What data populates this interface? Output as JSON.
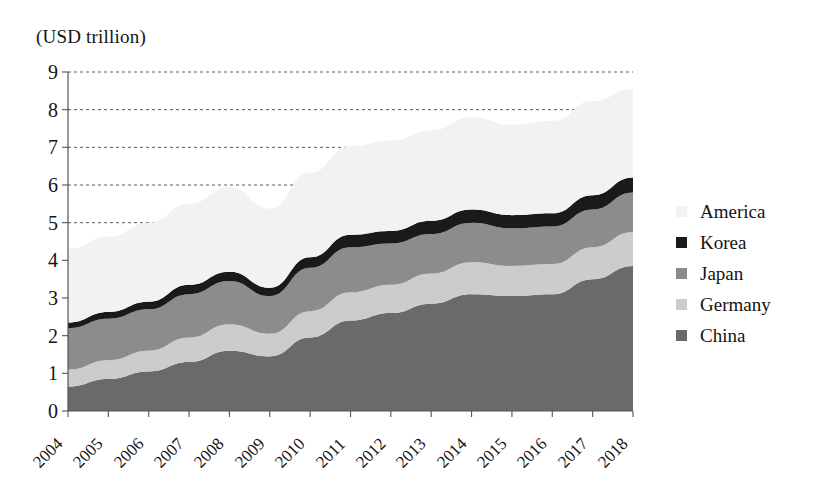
{
  "caption": {
    "unit": "(USD trillion)"
  },
  "legend": {
    "position": "right",
    "entries": [
      {
        "label": "America",
        "color": "#f2f2f2"
      },
      {
        "label": "Korea",
        "color": "#1a1a1a"
      },
      {
        "label": "Japan",
        "color": "#8c8c8c"
      },
      {
        "label": "Germany",
        "color": "#cccccc"
      },
      {
        "label": "China",
        "color": "#6a6a6a"
      }
    ]
  },
  "axes": {
    "y_label": "(USD trillion)",
    "y_ticks": [
      "9",
      "8",
      "7",
      "6",
      "5",
      "4",
      "3",
      "2",
      "1",
      "0"
    ],
    "x_ticks": [
      "2004",
      "2005",
      "2006",
      "2007",
      "2008",
      "2009",
      "2010",
      "2011",
      "2012",
      "2013",
      "2014",
      "2015",
      "2016",
      "2017",
      "2018"
    ]
  },
  "chart_data": {
    "type": "area",
    "stacked": true,
    "title": "",
    "subtitle": "",
    "xlabel": "",
    "ylabel": "(USD trillion)",
    "ylim": [
      0,
      9
    ],
    "grid": true,
    "grid_axis": "y",
    "grid_style": "dashed",
    "legend_position": "right",
    "x": [
      "2004",
      "2005",
      "2006",
      "2007",
      "2008",
      "2009",
      "2010",
      "2011",
      "2012",
      "2013",
      "2014",
      "2015",
      "2016",
      "2017",
      "2018"
    ],
    "stack_order_bottom_to_top": [
      "China",
      "Germany",
      "Japan",
      "Korea",
      "America"
    ],
    "series": [
      {
        "name": "China",
        "color": "#6a6a6a",
        "values": [
          0.65,
          0.85,
          1.05,
          1.3,
          1.6,
          1.45,
          1.95,
          2.4,
          2.6,
          2.85,
          3.1,
          3.05,
          3.1,
          3.5,
          3.85
        ]
      },
      {
        "name": "Germany",
        "color": "#cccccc",
        "values": [
          0.45,
          0.5,
          0.55,
          0.65,
          0.7,
          0.6,
          0.7,
          0.75,
          0.75,
          0.8,
          0.85,
          0.8,
          0.8,
          0.85,
          0.9
        ]
      },
      {
        "name": "Japan",
        "color": "#8c8c8c",
        "values": [
          1.1,
          1.1,
          1.1,
          1.15,
          1.15,
          1.0,
          1.15,
          1.2,
          1.1,
          1.05,
          1.05,
          1.0,
          1.0,
          1.0,
          1.05
        ]
      },
      {
        "name": "Korea",
        "color": "#1a1a1a",
        "values": [
          0.15,
          0.18,
          0.2,
          0.25,
          0.25,
          0.22,
          0.28,
          0.33,
          0.33,
          0.35,
          0.35,
          0.35,
          0.35,
          0.38,
          0.4
        ]
      },
      {
        "name": "America",
        "color": "#f2f2f2",
        "values": [
          1.95,
          2.0,
          2.1,
          2.15,
          2.25,
          2.1,
          2.25,
          2.35,
          2.4,
          2.4,
          2.45,
          2.4,
          2.45,
          2.5,
          2.35
        ]
      }
    ],
    "stacked_totals": [
      4.3,
      4.63,
      5.0,
      5.5,
      5.95,
      5.37,
      6.33,
      7.03,
      7.18,
      7.45,
      7.8,
      7.6,
      7.7,
      8.23,
      8.55
    ]
  }
}
